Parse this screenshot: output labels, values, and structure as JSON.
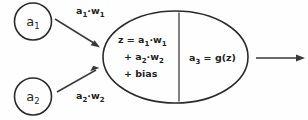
{
  "diagram": {
    "colors": {
      "stroke": "#2a2a2a",
      "text": "#1f1f1f",
      "background": "#fefefe"
    },
    "input_nodes": [
      {
        "id": "input-1",
        "base": "a",
        "subscript": "1"
      },
      {
        "id": "input-2",
        "base": "a",
        "subscript": "2"
      }
    ],
    "edges": [
      {
        "id": "edge-1",
        "from": "input-1",
        "to": "summation",
        "label_parts": [
          "a",
          "1",
          "·w",
          "1"
        ]
      },
      {
        "id": "edge-2",
        "from": "input-2",
        "to": "summation",
        "label_parts": [
          "a",
          "2",
          "·w",
          "2"
        ]
      }
    ],
    "summation": {
      "name": "summation-cell",
      "lines": [
        {
          "id": "sum-line-1",
          "parts": [
            "z = a",
            "1",
            "·w",
            "1"
          ]
        },
        {
          "id": "sum-line-2",
          "parts": [
            "+ a",
            "2",
            "·w",
            "2"
          ]
        },
        {
          "id": "sum-line-3",
          "parts": [
            "+ bias",
            "",
            "",
            ""
          ]
        }
      ]
    },
    "activation": {
      "name": "activation-cell",
      "base": "a",
      "subscript": "3",
      "expression": "= g(z)"
    },
    "output": {
      "name": "output-arrow",
      "label": ""
    }
  }
}
